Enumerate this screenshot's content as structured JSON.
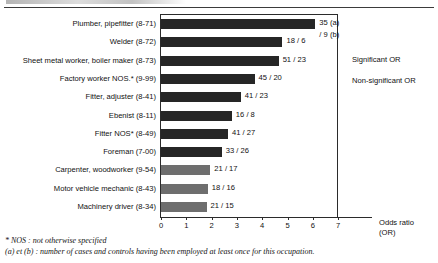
{
  "chart_data": {
    "type": "bar",
    "orientation": "horizontal",
    "title": "",
    "xlabel": "Odds ratio (OR)",
    "ylabel": "",
    "xlim": [
      0,
      7
    ],
    "xticks": [
      "0",
      "1",
      "2",
      "3",
      "4",
      "5",
      "6",
      "7"
    ],
    "grid": false,
    "legend_position": "right",
    "categories": [
      "Plumber, pipefitter (8-71)",
      "Welder (8-72)",
      "Sheet metal worker, boiler maker (8-73)",
      "Factory worker NOS.* (9-99)",
      "Fitter, adjuster (8-41)",
      "Ebenist (8-11)",
      "Fitter NOS* (8-49)",
      "Foreman (7-00)",
      "Carpenter, woodworker (9-54)",
      "Motor vehicle mechanic (8-43)",
      "Machinery driver (8-34)"
    ],
    "values": [
      6.1,
      4.8,
      4.65,
      3.7,
      3.15,
      2.8,
      2.65,
      2.4,
      1.95,
      1.85,
      1.8
    ],
    "data_labels": [
      "35 (a)",
      "18 / 6",
      "51 / 23",
      "45 / 20",
      "41 / 23",
      "16 / 8",
      "41 / 27",
      "33 / 26",
      "21 / 17",
      "18 / 16",
      "21 / 15"
    ],
    "data_labels_second_line": [
      "/ 9 (b)",
      "",
      "",
      "",
      "",
      "",
      "",
      "",
      "",
      "",
      ""
    ],
    "significance": [
      "significant",
      "significant",
      "significant",
      "significant",
      "significant",
      "significant",
      "significant",
      "significant",
      "non-significant",
      "non-significant",
      "non-significant"
    ],
    "colors": {
      "significant": "#262626",
      "non_significant": "#6e6e6e",
      "axis": "#2b2b2b",
      "text": "#111111"
    }
  },
  "legend": {
    "entries": [
      {
        "label": "Significant OR",
        "key": "significant"
      },
      {
        "label": "Non-significant OR",
        "key": "non-significant"
      }
    ]
  },
  "footnotes": [
    "* NOS : not otherwise specified",
    "(a) et (b) : number of cases and controls having been employed at least once for this occupation."
  ]
}
